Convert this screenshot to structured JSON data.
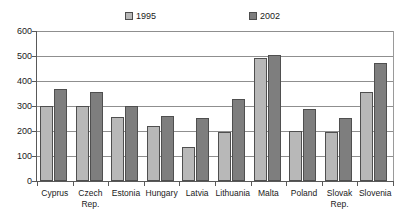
{
  "chart_data": {
    "type": "bar",
    "title": "",
    "xlabel": "",
    "ylabel": "",
    "ylim": [
      0,
      600
    ],
    "ytick_values": [
      0,
      100,
      200,
      300,
      400,
      500,
      600
    ],
    "ytick_labels": [
      "0",
      "100",
      "200",
      "300",
      "400",
      "500",
      "600"
    ],
    "grid": true,
    "legend_position": "top",
    "categories": [
      "Cyprus",
      "Czech Rep.",
      "Estonia",
      "Hungary",
      "Latvia",
      "Lithuania",
      "Malta",
      "Poland",
      "Slovak Rep.",
      "Slovenia"
    ],
    "category_lines": [
      [
        "Cyprus",
        ""
      ],
      [
        "Czech",
        "Rep."
      ],
      [
        "Estonia",
        ""
      ],
      [
        "Hungary",
        ""
      ],
      [
        "Latvia",
        ""
      ],
      [
        "Lithuania",
        ""
      ],
      [
        "Malta",
        ""
      ],
      [
        "Poland",
        ""
      ],
      [
        "Slovak",
        "Rep."
      ],
      [
        "Slovenia",
        ""
      ]
    ],
    "series": [
      {
        "name": "1995",
        "color": "#b8b8b8",
        "values": [
          300,
          300,
          258,
          220,
          135,
          195,
          492,
          200,
          195,
          358
        ]
      },
      {
        "name": "2002",
        "color": "#7e7e7e",
        "values": [
          370,
          358,
          300,
          260,
          252,
          330,
          505,
          290,
          252,
          472
        ]
      }
    ]
  },
  "legend": {
    "entries": [
      {
        "label": "1995"
      },
      {
        "label": "2002"
      }
    ]
  },
  "colors": {
    "series_1995": "#b8b8b8",
    "series_2002": "#7e7e7e",
    "axis": "#595959",
    "gridline": "#8f8f8f",
    "text": "#1a1a1a",
    "background": "#ffffff"
  }
}
